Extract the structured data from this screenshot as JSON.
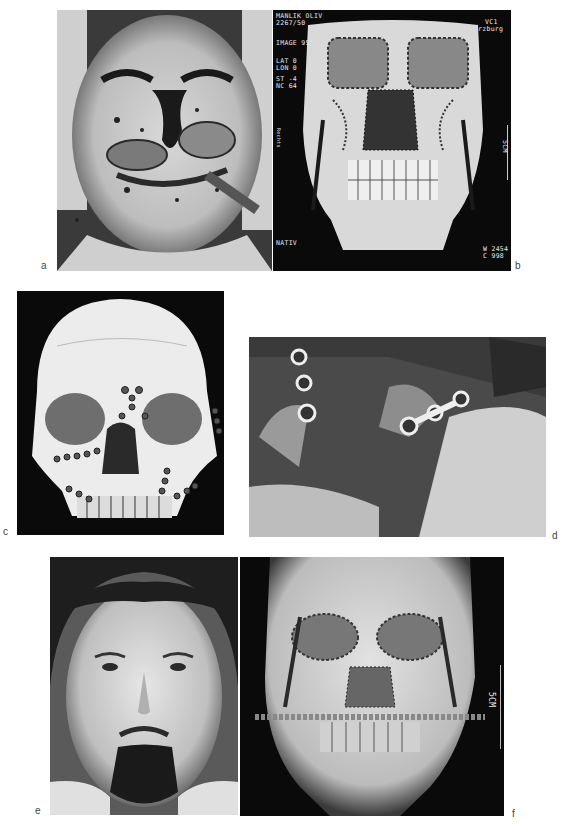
{
  "figure": {
    "panels": [
      {
        "id": "a",
        "label": "a",
        "description": "Preoperative facial photograph with severe midface trauma"
      },
      {
        "id": "b",
        "label": "b",
        "description": "3D CT reconstruction of fractured facial skeleton",
        "overlay": {
          "patient_name": "MANLIK OLIV",
          "patient_id": "2267/50",
          "image_no": "IMAGE 95",
          "lat": "LAT 0",
          "lon": "LON 0",
          "st": "ST -4",
          "nc": "NC 64",
          "institution_top": "VC1",
          "institution_city": "rzburg",
          "mode": "NATIV",
          "window_w": "W 2454",
          "window_c": "C 998",
          "scale_left": "Rechts",
          "scale_right": "5CM"
        }
      },
      {
        "id": "c",
        "label": "c",
        "description": "Skull model showing miniplate osteosynthesis"
      },
      {
        "id": "d",
        "label": "d",
        "description": "Intraoperative view of miniplate fixation"
      },
      {
        "id": "e",
        "label": "e",
        "description": "Postoperative facial photograph"
      },
      {
        "id": "f",
        "label": "f",
        "description": "Postoperative 3D CT reconstruction",
        "overlay": {
          "scale": "5CM"
        }
      }
    ]
  },
  "colors": {
    "background": "#ffffff",
    "label": "#444444",
    "ct_bg": "#0a0a0a",
    "bone": "#e6e6e6"
  }
}
